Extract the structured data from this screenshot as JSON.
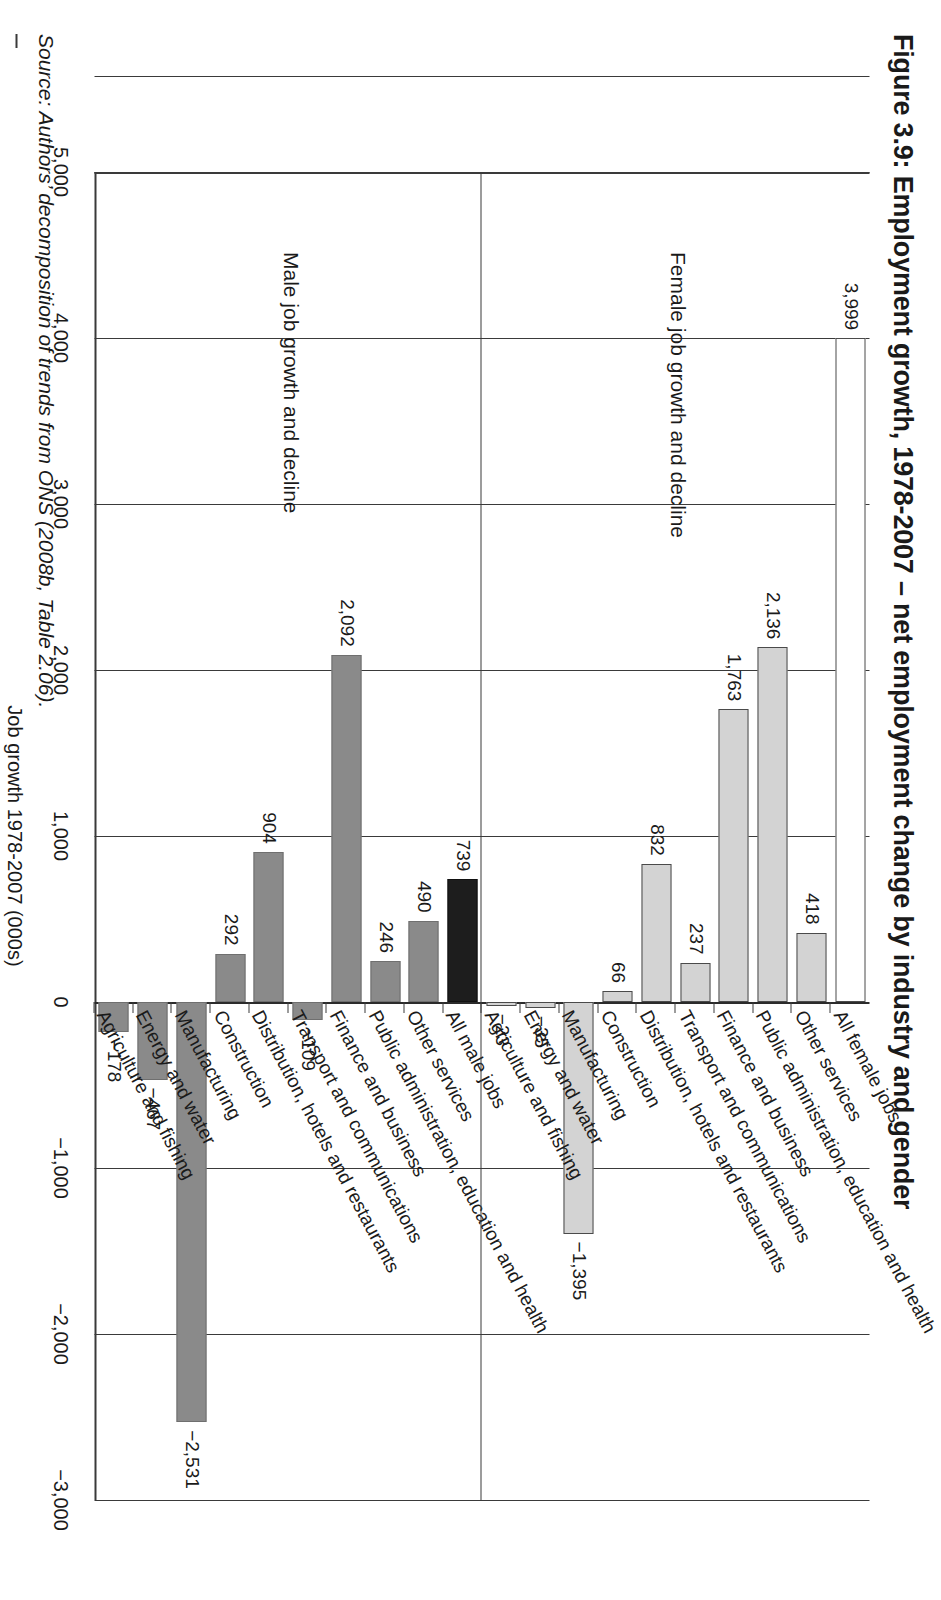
{
  "figure": {
    "title": "Figure 3.9: Employment growth, 1978-2007 – net employment change by industry and gender",
    "source_note": "Source: Authors’ decomposition of trends from ONS (2008b, Table 2.06)."
  },
  "panels": {
    "male_caption": "Male job growth and decline",
    "female_caption": "Female job growth and decline"
  },
  "axis": {
    "title": "Job growth 1978-2007 (000s)",
    "ticks": [
      "5,000",
      "4,000",
      "3,000",
      "2,000",
      "1,000",
      "0",
      "-1,000",
      "-2,000",
      "-3,000"
    ],
    "tick_values": [
      5000,
      4000,
      3000,
      2000,
      1000,
      0,
      -1000,
      -2000,
      -3000
    ],
    "min": -3000,
    "max": 5000
  },
  "colors": {
    "male_bar": "#8a8a8a",
    "male_total_bar": "#1d1d1d",
    "female_bar": "#d3d3d3",
    "female_total_bar": "#ffffff",
    "axis": "#3a3a3a"
  },
  "chart_data": {
    "type": "bar",
    "title": "Figure 3.9: Employment growth, 1978-2007 – net employment change by industry and gender",
    "xlabel": "",
    "ylabel": "Job growth 1978-2007 (000s)",
    "ylim": [
      -3000,
      5000
    ],
    "orientation": "horizontal",
    "grid": true,
    "legend": "none",
    "categories": [
      "Agriculture and fishing",
      "Energy and water",
      "Manufacturing",
      "Construction",
      "Distribution, hotels and restaurants",
      "Transport and communications",
      "Finance and business",
      "Public administration, education and health",
      "Other services",
      "All jobs"
    ],
    "series": [
      {
        "name": "Male job growth and decline",
        "labels": [
          "-178",
          "-467",
          "-2,531",
          "292",
          "904",
          "-109",
          "2,092",
          "246",
          "490",
          "739"
        ],
        "values": [
          -178,
          -467,
          -2531,
          292,
          904,
          -109,
          2092,
          246,
          490,
          739
        ],
        "total_label": "All male jobs",
        "total_value": 739
      },
      {
        "name": "Female job growth and decline",
        "labels": [
          "-23",
          "-35",
          "-1,395",
          "66",
          "832",
          "237",
          "1,763",
          "2,136",
          "418",
          "3,999"
        ],
        "values": [
          -23,
          -35,
          -1395,
          66,
          832,
          237,
          1763,
          2136,
          418,
          3999
        ],
        "total_label": "All female jobs",
        "total_value": 3999
      }
    ]
  },
  "bars": {
    "male": [
      {
        "category": "Agriculture and fishing",
        "label": "-178",
        "value": -178,
        "kind": "male"
      },
      {
        "category": "Energy and water",
        "label": "-467",
        "value": -467,
        "kind": "male"
      },
      {
        "category": "Manufacturing",
        "label": "-2,531",
        "value": -2531,
        "kind": "male"
      },
      {
        "category": "Construction",
        "label": "292",
        "value": 292,
        "kind": "male"
      },
      {
        "category": "Distribution, hotels and restaurants",
        "label": "904",
        "value": 904,
        "kind": "male"
      },
      {
        "category": "Transport and communications",
        "label": "-109",
        "value": -109,
        "kind": "male"
      },
      {
        "category": "Finance and business",
        "label": "2,092",
        "value": 2092,
        "kind": "male"
      },
      {
        "category": "Public administration, education and health",
        "label": "246",
        "value": 246,
        "kind": "male"
      },
      {
        "category": "Other services",
        "label": "490",
        "value": 490,
        "kind": "male"
      },
      {
        "category": "All male jobs",
        "label": "739",
        "value": 739,
        "kind": "male-total"
      }
    ],
    "female": [
      {
        "category": "Agriculture and fishing",
        "label": "-23",
        "value": -23,
        "kind": "female"
      },
      {
        "category": "Energy and water",
        "label": "-35",
        "value": -35,
        "kind": "female"
      },
      {
        "category": "Manufacturing",
        "label": "-1,395",
        "value": -1395,
        "kind": "female"
      },
      {
        "category": "Construction",
        "label": "66",
        "value": 66,
        "kind": "female"
      },
      {
        "category": "Distribution, hotels and restaurants",
        "label": "832",
        "value": 832,
        "kind": "female"
      },
      {
        "category": "Transport and communications",
        "label": "237",
        "value": 237,
        "kind": "female"
      },
      {
        "category": "Finance and business",
        "label": "1,763",
        "value": 1763,
        "kind": "female"
      },
      {
        "category": "Public administration, education and health",
        "label": "2,136",
        "value": 2136,
        "kind": "female"
      },
      {
        "category": "Other services",
        "label": "418",
        "value": 418,
        "kind": "female"
      },
      {
        "category": "All female jobs",
        "label": "3,999",
        "value": 3999,
        "kind": "female-total"
      }
    ]
  }
}
